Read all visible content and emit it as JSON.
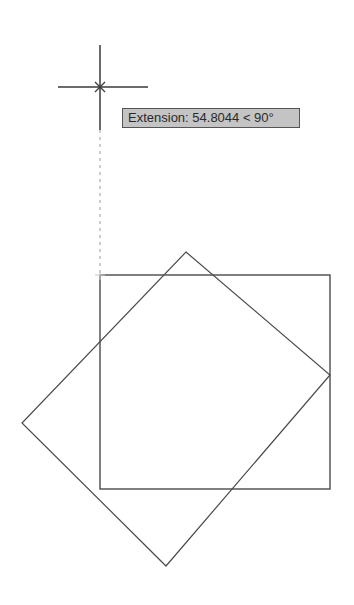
{
  "drawing": {
    "background": "#ffffff",
    "line_color": "#4a4a4a",
    "cursor": {
      "center": [
        100,
        87
      ],
      "vertical": [
        [
          100,
          45
        ],
        [
          100,
          130
        ]
      ],
      "horizontal": [
        [
          58,
          87
        ],
        [
          148,
          87
        ]
      ]
    },
    "extension_line": {
      "from": [
        100,
        130
      ],
      "to": [
        100,
        275
      ],
      "style": "dashed",
      "color": "#9a9a9a"
    },
    "rectangle": {
      "x": 100,
      "y": 275,
      "width": 230,
      "height": 214
    },
    "diamond": {
      "points": [
        [
          186,
          252
        ],
        [
          330,
          375
        ],
        [
          166,
          566
        ],
        [
          22,
          423
        ]
      ]
    }
  },
  "tooltip": {
    "label": "Extension: 54.8044 < 90°",
    "background": "#c4c4c4",
    "border": "#555555"
  }
}
